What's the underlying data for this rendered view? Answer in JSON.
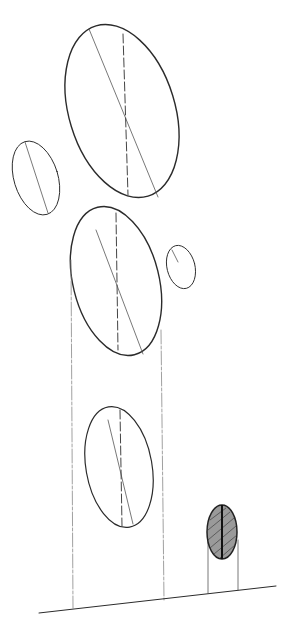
{
  "image": {
    "kind": "pencil sketch",
    "width": 293,
    "height": 633,
    "background": "#ffffff",
    "ink_color": "#2b2b2b"
  },
  "shapes": {
    "ellipse_top_large": {
      "cx": 122,
      "cy": 111,
      "rx": 53,
      "ry": 89,
      "rotate": -17
    },
    "ellipse_left_small": {
      "cx": 36,
      "cy": 178,
      "rx": 22,
      "ry": 38,
      "rotate": -17
    },
    "ellipse_middle": {
      "cx": 116,
      "cy": 281,
      "rx": 43,
      "ry": 76,
      "rotate": -14
    },
    "ellipse_right_small": {
      "cx": 181,
      "cy": 267,
      "rx": 14,
      "ry": 22,
      "rotate": -14
    },
    "ellipse_lower": {
      "cx": 119,
      "cy": 467,
      "rx": 33,
      "ry": 61,
      "rotate": -10
    },
    "ellipse_shaded_small": {
      "cx": 222,
      "cy": 532,
      "rx": 15,
      "ry": 27,
      "rotate": 0
    }
  }
}
